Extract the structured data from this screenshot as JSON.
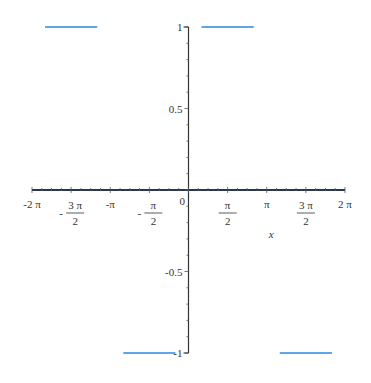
{
  "chart_data": {
    "type": "line",
    "title": "",
    "xlabel": "x",
    "ylabel": "",
    "xlim": [
      -6.2832,
      6.2832
    ],
    "ylim": [
      -1,
      1
    ],
    "grid": false,
    "legend": null,
    "x_ticks": [
      {
        "value": -6.2832,
        "label": "-2 π",
        "num": "",
        "den": ""
      },
      {
        "value": -4.7124,
        "label": "",
        "num": "3 π",
        "den": "2",
        "neg": true
      },
      {
        "value": -3.1416,
        "label": "-π",
        "num": "",
        "den": ""
      },
      {
        "value": -1.5708,
        "label": "",
        "num": "π",
        "den": "2",
        "neg": true
      },
      {
        "value": 1.5708,
        "label": "",
        "num": "π",
        "den": "2",
        "neg": false
      },
      {
        "value": 3.1416,
        "label": "π",
        "num": "",
        "den": ""
      },
      {
        "value": 4.7124,
        "label": "",
        "num": "3 π",
        "den": "2",
        "neg": false
      },
      {
        "value": 6.2832,
        "label": "2 π",
        "num": "",
        "den": ""
      }
    ],
    "origin_label": "0",
    "y_ticks": [
      {
        "value": 1,
        "label": "1"
      },
      {
        "value": 0.5,
        "label": "0.5"
      },
      {
        "value": -0.5,
        "label": "-0.5"
      },
      {
        "value": -1,
        "label": "-1"
      }
    ],
    "series": [
      {
        "name": "f(x)",
        "color": "#5fa6e6",
        "zero_color": "#1f3a6b",
        "segments": [
          {
            "x0": -5.7596,
            "x1": -3.6652,
            "y": 1
          },
          {
            "x0": -2.618,
            "x1": -0.5236,
            "y": -1
          },
          {
            "x0": 0.5236,
            "x1": 2.618,
            "y": 1
          },
          {
            "x0": 3.6652,
            "x1": 5.7596,
            "y": -1
          },
          {
            "x0": -6.2832,
            "x1": 6.2832,
            "y": 0
          }
        ]
      }
    ]
  },
  "colors": {
    "axis": "#333333",
    "plot_line": "#5fa6e6",
    "zero_line": "#1f3a6b"
  }
}
